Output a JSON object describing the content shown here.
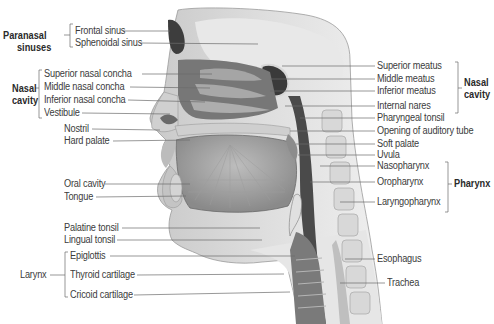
{
  "figure": {
    "left_groups": [
      {
        "name": "Paranasal sinuses",
        "line1": "Paranasal",
        "line2": "sinuses",
        "bold": true,
        "items": [
          "Frontal sinus",
          "Sphenoidal sinus"
        ]
      },
      {
        "name": "Nasal cavity",
        "line1": "Nasal",
        "line2": "cavity",
        "bold": true,
        "items": [
          "Superior nasal concha",
          "Middle nasal concha",
          "Inferior nasal concha",
          "Vestibule"
        ]
      },
      {
        "name": "Larynx",
        "line1": "Larynx",
        "bold": false,
        "items": [
          "Epiglottis",
          "Thyroid cartilage",
          "Cricoid cartilage"
        ]
      }
    ],
    "left_labels": [
      "Nostril",
      "Hard palate",
      "Oral cavity",
      "Tongue",
      "Palatine tonsil",
      "Lingual tonsil"
    ],
    "right_groups": [
      {
        "name": "Nasal cavity",
        "line1": "Nasal",
        "line2": "cavity",
        "bold": true,
        "items": [
          "Superior meatus",
          "Middle meatus",
          "Inferior meatus",
          "Internal nares"
        ]
      },
      {
        "name": "Pharynx",
        "line1": "Pharynx",
        "bold": true,
        "items": [
          "Nasopharynx",
          "Oropharynx",
          "Laryngopharynx"
        ]
      }
    ],
    "right_labels": [
      "Pharyngeal tonsil",
      "Opening of auditory tube",
      "Soft palate",
      "Uvula",
      "Esophagus",
      "Trachea"
    ]
  }
}
